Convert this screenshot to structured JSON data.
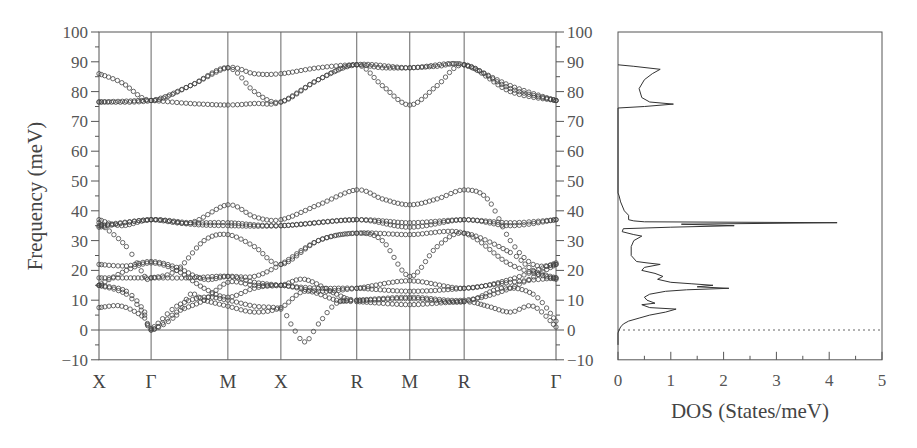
{
  "chart_data": [
    {
      "type": "scatter",
      "title": "",
      "description": "Phonon dispersion along high-symmetry path",
      "xlabel": "",
      "ylabel": "Frequency (meV)",
      "ylim": [
        -10,
        100
      ],
      "yticks": [
        -10,
        0,
        10,
        20,
        30,
        40,
        50,
        60,
        70,
        80,
        90,
        100
      ],
      "ytick_labels_left": [
        "−10",
        "0",
        "10",
        "20",
        "30",
        "40",
        "50",
        "60",
        "70",
        "80",
        "90",
        "100"
      ],
      "ytick_labels_right": [
        "−10",
        "0",
        "10",
        "20",
        "30",
        "40",
        "50",
        "60",
        "70",
        "80",
        "90",
        "100"
      ],
      "high_symmetry_points": [
        "X",
        "Γ",
        "M",
        "X",
        "R",
        "M",
        "R",
        "Γ"
      ],
      "high_symmetry_positions": [
        0,
        0.114,
        0.282,
        0.398,
        0.564,
        0.68,
        0.799,
        1.0
      ],
      "grid": "vertical lines at high-symmetry points, horizontal line at 0",
      "marker": "open circles",
      "series": [
        {
          "name": "branch-1",
          "points": [
            [
              0,
              86
            ],
            [
              0.05,
              83
            ],
            [
              0.114,
              77
            ],
            [
              0.2,
              82
            ],
            [
              0.282,
              88
            ],
            [
              0.34,
              86
            ],
            [
              0.398,
              86
            ],
            [
              0.48,
              88
            ],
            [
              0.564,
              89
            ],
            [
              0.62,
              88
            ],
            [
              0.68,
              88
            ],
            [
              0.74,
              88.5
            ],
            [
              0.799,
              89
            ],
            [
              0.9,
              82
            ],
            [
              1.0,
              77
            ]
          ]
        },
        {
          "name": "branch-2",
          "points": [
            [
              0,
              76.5
            ],
            [
              0.06,
              76.8
            ],
            [
              0.114,
              77
            ],
            [
              0.2,
              76
            ],
            [
              0.282,
              75.5
            ],
            [
              0.34,
              76
            ],
            [
              0.398,
              76.5
            ],
            [
              0.48,
              84
            ],
            [
              0.564,
              89
            ],
            [
              0.62,
              82
            ],
            [
              0.68,
              75.5
            ],
            [
              0.74,
              82
            ],
            [
              0.799,
              89
            ],
            [
              0.9,
              81
            ],
            [
              1.0,
              77
            ]
          ]
        },
        {
          "name": "branch-3",
          "points": [
            [
              0,
              76.5
            ],
            [
              0.114,
              77
            ],
            [
              0.2,
              82
            ],
            [
              0.282,
              88
            ],
            [
              0.34,
              80
            ],
            [
              0.398,
              76.5
            ],
            [
              0.48,
              84
            ],
            [
              0.564,
              89
            ],
            [
              0.68,
              88
            ],
            [
              0.799,
              89
            ],
            [
              0.9,
              80
            ],
            [
              1.0,
              77
            ]
          ]
        },
        {
          "name": "branch-4",
          "points": [
            [
              0,
              37
            ],
            [
              0.05,
              35
            ],
            [
              0.114,
              37
            ],
            [
              0.2,
              36
            ],
            [
              0.282,
              42
            ],
            [
              0.34,
              38
            ],
            [
              0.398,
              37
            ],
            [
              0.48,
              42
            ],
            [
              0.564,
              47
            ],
            [
              0.62,
              44
            ],
            [
              0.68,
              42
            ],
            [
              0.74,
              44
            ],
            [
              0.799,
              47
            ],
            [
              0.85,
              44
            ],
            [
              0.9,
              30
            ],
            [
              0.95,
              22
            ],
            [
              1.0,
              22
            ]
          ]
        },
        {
          "name": "branch-5",
          "points": [
            [
              0,
              35
            ],
            [
              0.114,
              37
            ],
            [
              0.2,
              36
            ],
            [
              0.282,
              36
            ],
            [
              0.398,
              35
            ],
            [
              0.564,
              37
            ],
            [
              0.68,
              36
            ],
            [
              0.799,
              37
            ],
            [
              0.9,
              36
            ],
            [
              1.0,
              37
            ]
          ]
        },
        {
          "name": "branch-6",
          "points": [
            [
              0,
              34.5
            ],
            [
              0.114,
              37
            ],
            [
              0.2,
              35.5
            ],
            [
              0.282,
              35
            ],
            [
              0.398,
              35
            ],
            [
              0.564,
              37
            ],
            [
              0.68,
              34.5
            ],
            [
              0.799,
              37
            ],
            [
              0.9,
              35
            ],
            [
              1.0,
              37
            ]
          ]
        },
        {
          "name": "branch-7",
          "points": [
            [
              0,
              36
            ],
            [
              0.06,
              28
            ],
            [
              0.1,
              18
            ],
            [
              0.114,
              17.5
            ],
            [
              0.17,
              20
            ],
            [
              0.23,
              30
            ],
            [
              0.282,
              32
            ],
            [
              0.34,
              28
            ],
            [
              0.398,
              22
            ],
            [
              0.48,
              30
            ],
            [
              0.564,
              32.5
            ],
            [
              0.62,
              30
            ],
            [
              0.68,
              18
            ],
            [
              0.74,
              28
            ],
            [
              0.799,
              32.5
            ],
            [
              0.9,
              26
            ],
            [
              0.95,
              20
            ],
            [
              1.0,
              17.5
            ]
          ]
        },
        {
          "name": "branch-8",
          "points": [
            [
              0,
              22
            ],
            [
              0.06,
              21.5
            ],
            [
              0.114,
              23
            ],
            [
              0.17,
              21
            ],
            [
              0.23,
              17
            ],
            [
              0.282,
              18
            ],
            [
              0.34,
              18
            ],
            [
              0.398,
              22
            ],
            [
              0.48,
              30
            ],
            [
              0.564,
              32.5
            ],
            [
              0.68,
              32
            ],
            [
              0.799,
              32.5
            ],
            [
              0.9,
              22
            ],
            [
              1.0,
              17
            ]
          ]
        },
        {
          "name": "branch-9",
          "points": [
            [
              0,
              15
            ],
            [
              0.06,
              20
            ],
            [
              0.114,
              22.5
            ],
            [
              0.17,
              20
            ],
            [
              0.23,
              14
            ],
            [
              0.282,
              11
            ],
            [
              0.34,
              14
            ],
            [
              0.398,
              15
            ],
            [
              0.48,
              13
            ],
            [
              0.564,
              14
            ],
            [
              0.68,
              16.5
            ],
            [
              0.799,
              14
            ],
            [
              0.9,
              17
            ],
            [
              1.0,
              22.5
            ]
          ]
        },
        {
          "name": "branch-10",
          "points": [
            [
              0,
              17.5
            ],
            [
              0.06,
              17.5
            ],
            [
              0.114,
              17.5
            ],
            [
              0.2,
              17.5
            ],
            [
              0.282,
              18
            ],
            [
              0.34,
              16
            ],
            [
              0.398,
              15
            ],
            [
              0.48,
              14
            ],
            [
              0.564,
              14
            ],
            [
              0.68,
              13
            ],
            [
              0.799,
              14
            ],
            [
              0.9,
              16
            ],
            [
              1.0,
              17.5
            ]
          ]
        },
        {
          "name": "branch-11",
          "points": [
            [
              0,
              15
            ],
            [
              0.06,
              12
            ],
            [
              0.1,
              5
            ],
            [
              0.114,
              0.5
            ],
            [
              0.17,
              8
            ],
            [
              0.23,
              11
            ],
            [
              0.282,
              10
            ],
            [
              0.34,
              8
            ],
            [
              0.398,
              7
            ],
            [
              0.42,
              2
            ],
            [
              0.45,
              -4
            ],
            [
              0.48,
              2
            ],
            [
              0.52,
              9
            ],
            [
              0.564,
              9.5
            ],
            [
              0.68,
              8.5
            ],
            [
              0.799,
              9.5
            ],
            [
              0.85,
              8
            ],
            [
              0.9,
              6
            ],
            [
              0.95,
              8
            ],
            [
              1.0,
              1
            ]
          ]
        },
        {
          "name": "branch-12",
          "points": [
            [
              0,
              15
            ],
            [
              0.06,
              13
            ],
            [
              0.1,
              6
            ],
            [
              0.114,
              0
            ],
            [
              0.17,
              6
            ],
            [
              0.23,
              10
            ],
            [
              0.282,
              16
            ],
            [
              0.34,
              15
            ],
            [
              0.398,
              15
            ],
            [
              0.45,
              17
            ],
            [
              0.52,
              12
            ],
            [
              0.564,
              10
            ],
            [
              0.68,
              10.5
            ],
            [
              0.799,
              9.5
            ],
            [
              0.88,
              14
            ],
            [
              0.95,
              12
            ],
            [
              1.0,
              3
            ]
          ]
        },
        {
          "name": "branch-13",
          "points": [
            [
              0,
              7.5
            ],
            [
              0.05,
              8
            ],
            [
              0.1,
              4
            ],
            [
              0.114,
              0
            ],
            [
              0.17,
              5
            ],
            [
              0.2,
              12
            ],
            [
              0.23,
              10
            ],
            [
              0.282,
              8
            ],
            [
              0.34,
              6
            ],
            [
              0.398,
              7.5
            ],
            [
              0.45,
              13
            ],
            [
              0.52,
              10
            ],
            [
              0.564,
              10
            ],
            [
              0.68,
              11
            ],
            [
              0.799,
              10
            ],
            [
              0.9,
              14
            ],
            [
              1.0,
              22
            ]
          ]
        }
      ]
    },
    {
      "type": "line",
      "title": "",
      "description": "Phonon density of states",
      "xlabel": "DOS (States/meV)",
      "ylabel": "",
      "xlim": [
        0,
        5
      ],
      "ylim": [
        -10,
        100
      ],
      "xticks": [
        0,
        1,
        2,
        3,
        4,
        5
      ],
      "xtick_labels": [
        "0",
        "1",
        "2",
        "3",
        "4",
        "5"
      ],
      "reference_line": {
        "y": 0,
        "style": "dashed"
      },
      "curve": [
        [
          0,
          -5
        ],
        [
          0,
          -1
        ],
        [
          0.02,
          0
        ],
        [
          0.05,
          1
        ],
        [
          0.1,
          2
        ],
        [
          0.2,
          3
        ],
        [
          0.4,
          4
        ],
        [
          0.6,
          5
        ],
        [
          0.9,
          6
        ],
        [
          1.1,
          7
        ],
        [
          0.6,
          7.5
        ],
        [
          0.45,
          8.5
        ],
        [
          0.7,
          9
        ],
        [
          0.55,
          10
        ],
        [
          0.5,
          11
        ],
        [
          0.6,
          12
        ],
        [
          0.9,
          13
        ],
        [
          1.3,
          13.5
        ],
        [
          2.1,
          14
        ],
        [
          1.5,
          14.5
        ],
        [
          1.8,
          15
        ],
        [
          1.4,
          15.5
        ],
        [
          1.0,
          16
        ],
        [
          0.75,
          17
        ],
        [
          0.85,
          18
        ],
        [
          0.7,
          19
        ],
        [
          0.45,
          20
        ],
        [
          0.5,
          21
        ],
        [
          0.8,
          22
        ],
        [
          0.55,
          22.5
        ],
        [
          0.35,
          23
        ],
        [
          0.25,
          25
        ],
        [
          0.25,
          28
        ],
        [
          0.3,
          30
        ],
        [
          0.45,
          31.5
        ],
        [
          0.3,
          32
        ],
        [
          0.08,
          33
        ],
        [
          0.1,
          34
        ],
        [
          1.0,
          34.5
        ],
        [
          2.2,
          35
        ],
        [
          1.2,
          35.5
        ],
        [
          4.15,
          36
        ],
        [
          0.5,
          36.3
        ],
        [
          0.3,
          36.6
        ],
        [
          0.2,
          37
        ],
        [
          0.2,
          38.5
        ],
        [
          0.12,
          40
        ],
        [
          0.05,
          43
        ],
        [
          0.02,
          45
        ],
        [
          0,
          46
        ],
        [
          0,
          74.5
        ],
        [
          0.5,
          75
        ],
        [
          1.05,
          75.8
        ],
        [
          0.6,
          76.5
        ],
        [
          0.45,
          78
        ],
        [
          0.4,
          81
        ],
        [
          0.5,
          84
        ],
        [
          0.65,
          86
        ],
        [
          0.8,
          87.5
        ],
        [
          0.3,
          88.5
        ],
        [
          0,
          89
        ]
      ]
    }
  ],
  "left_panel": {
    "ylabel": "Frequency (meV)",
    "sym_labels": [
      "X",
      "Γ",
      "M",
      "X",
      "R",
      "M",
      "R",
      "Γ"
    ]
  },
  "right_panel": {
    "xlabel": "DOS (States/meV)"
  }
}
